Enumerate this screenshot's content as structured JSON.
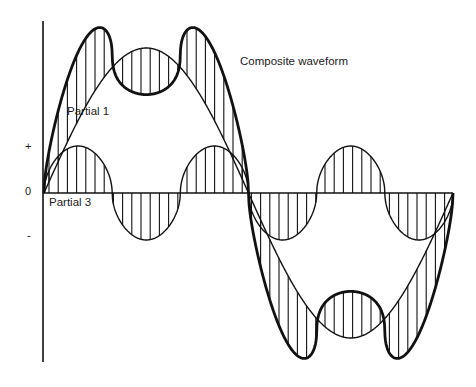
{
  "diagram": {
    "type": "waveform-composition",
    "labels": {
      "composite": "Composite waveform",
      "partial1": "Partial 1",
      "partial3": "Partial 3"
    },
    "axis_labels": {
      "plus": "+",
      "zero": "0",
      "minus": "-"
    },
    "geometry": {
      "axis_x": 43,
      "axis_top": 21,
      "axis_bottom": 362,
      "zero_y": 193,
      "zero_line_end_x": 453,
      "wave_start_x": 44,
      "half_period_px": 204.5,
      "partial1_amplitude": 145,
      "partial3_amplitude": 47,
      "partial3_flatten_exponent": 0.5,
      "composite_p1_scale": 1.1,
      "composite_p3_scale": 1.3,
      "hatch_spacing_px": 9.2
    },
    "colors": {
      "ink": "#111111",
      "background": "#ffffff"
    }
  }
}
